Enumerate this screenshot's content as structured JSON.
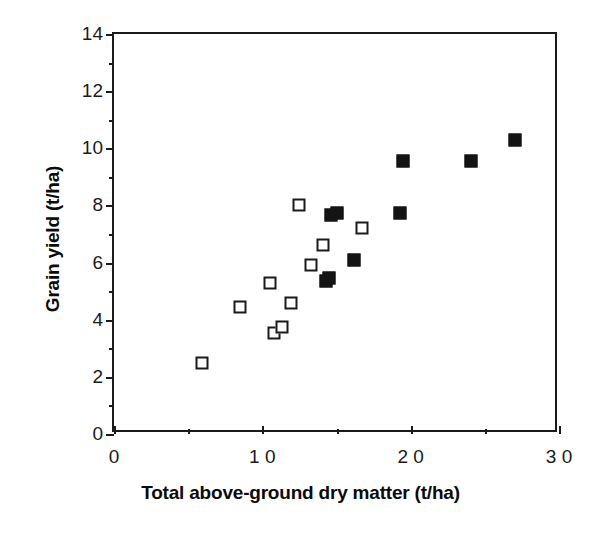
{
  "chart_data": {
    "type": "scatter",
    "title": "",
    "xlabel": "Total above-ground dry matter (t/ha)",
    "ylabel": "Grain yield (t/ha)",
    "xlim": [
      0,
      3.0
    ],
    "ylim": [
      0,
      14
    ],
    "xticks": [
      0,
      1.0,
      2.0,
      3.0
    ],
    "xtick_labels": [
      "0",
      "1 0",
      "2 0",
      "3 0"
    ],
    "xminor_ticks": [
      0.5,
      1.5,
      2.5
    ],
    "yticks": [
      0,
      2,
      4,
      6,
      8,
      10,
      12,
      14
    ],
    "ytick_labels": [
      "0",
      "2",
      "4",
      "6",
      "8",
      "10",
      "12",
      "14"
    ],
    "yminor_ticks": [
      1,
      3,
      5,
      7,
      9,
      11,
      13
    ],
    "grid": false,
    "legend": null,
    "marker_color": "#141414",
    "series": [
      {
        "name": "open-squares",
        "marker": "open-square",
        "points": [
          {
            "x": 0.59,
            "y": 2.5
          },
          {
            "x": 0.85,
            "y": 4.45
          },
          {
            "x": 1.05,
            "y": 5.3
          },
          {
            "x": 1.08,
            "y": 3.55
          },
          {
            "x": 1.13,
            "y": 3.75
          },
          {
            "x": 1.19,
            "y": 4.6
          },
          {
            "x": 1.25,
            "y": 8.0
          },
          {
            "x": 1.33,
            "y": 5.9
          },
          {
            "x": 1.41,
            "y": 6.6
          },
          {
            "x": 1.67,
            "y": 7.2
          }
        ]
      },
      {
        "name": "filled-squares",
        "marker": "filled-square",
        "points": [
          {
            "x": 1.43,
            "y": 5.35
          },
          {
            "x": 1.45,
            "y": 5.45
          },
          {
            "x": 1.46,
            "y": 7.65
          },
          {
            "x": 1.5,
            "y": 7.75
          },
          {
            "x": 1.62,
            "y": 6.1
          },
          {
            "x": 1.93,
            "y": 7.75
          },
          {
            "x": 1.95,
            "y": 9.55
          },
          {
            "x": 2.41,
            "y": 9.55
          },
          {
            "x": 2.7,
            "y": 10.3
          }
        ]
      }
    ]
  }
}
